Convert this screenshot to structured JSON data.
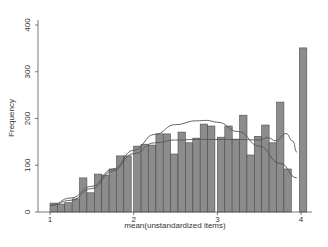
{
  "chart_data": {
    "type": "bar",
    "title": "",
    "xlabel": "mean(unstandardized items)",
    "ylabel": "Frequency",
    "xlim": [
      1,
      4
    ],
    "ylim": [
      0,
      400
    ],
    "xticks": [
      "1",
      "2",
      "3",
      "4"
    ],
    "yticks": [
      "0",
      "100",
      "200",
      "300",
      "400"
    ],
    "grid": false,
    "legend": null,
    "histogram": {
      "bin_left_edges": [
        1.0,
        1.088,
        1.176,
        1.265,
        1.353,
        1.441,
        1.529,
        1.618,
        1.706,
        1.794,
        1.882,
        2.0,
        2.088,
        2.176,
        2.265,
        2.353,
        2.441,
        2.529,
        2.618,
        2.706,
        2.794,
        2.882,
        3.0,
        3.088,
        3.176,
        3.265,
        3.353,
        3.441,
        3.529,
        3.618,
        3.706,
        3.794,
        3.98
      ],
      "bin_width": 0.088,
      "values": [
        19,
        17,
        20,
        28,
        73,
        41,
        81,
        79,
        92,
        120,
        120,
        141,
        145,
        143,
        167,
        167,
        124,
        171,
        148,
        158,
        188,
        184,
        160,
        184,
        156,
        207,
        122,
        162,
        186,
        148,
        235,
        92,
        351
      ]
    },
    "series": [
      {
        "name": "normal density",
        "type": "line",
        "x": [
          1.0,
          1.25,
          1.5,
          1.75,
          2.0,
          2.25,
          2.5,
          2.75,
          2.87,
          3.0,
          3.25,
          3.5,
          3.75,
          3.95
        ],
        "values": [
          14,
          30,
          55,
          92,
          132,
          166,
          187,
          195,
          196,
          192,
          172,
          141,
          104,
          73
        ]
      },
      {
        "name": "kernel density",
        "type": "line",
        "x": [
          1.0,
          1.25,
          1.5,
          1.75,
          2.0,
          2.25,
          2.5,
          2.75,
          3.0,
          3.25,
          3.5,
          3.6,
          3.7,
          3.82,
          3.9,
          3.95
        ],
        "values": [
          14,
          25,
          50,
          88,
          125,
          148,
          154,
          155,
          155,
          155,
          154,
          159,
          152,
          168,
          152,
          128
        ]
      }
    ]
  },
  "colors": {
    "bar_fill": "#8c8c8c",
    "bar_stroke": "#4a4a4a",
    "axis": "#555555",
    "curve": "#555555"
  }
}
